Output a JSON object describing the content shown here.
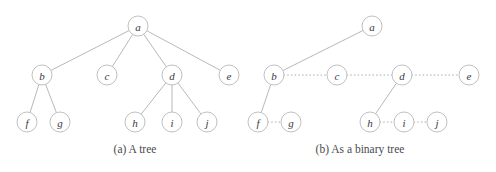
{
  "figure": {
    "width": 496,
    "height": 172,
    "background": "#ffffff",
    "node_radius": 10,
    "node_stroke": "#b9b9bd",
    "node_fill": "#ffffff",
    "edge_color": "#b0b0b5",
    "label_color": "#3a3a3f",
    "caption_color": "#4a4a4e"
  },
  "panels": [
    {
      "id": "panel-a",
      "caption": "(a) A tree",
      "caption_x": 135,
      "caption_y": 153,
      "nodes": [
        {
          "id": "a",
          "label": "a",
          "x": 138,
          "y": 26
        },
        {
          "id": "b",
          "label": "b",
          "x": 42,
          "y": 75
        },
        {
          "id": "c",
          "label": "c",
          "x": 107,
          "y": 75
        },
        {
          "id": "d",
          "label": "d",
          "x": 172,
          "y": 75
        },
        {
          "id": "e",
          "label": "e",
          "x": 229,
          "y": 75
        },
        {
          "id": "f",
          "label": "f",
          "x": 27,
          "y": 122
        },
        {
          "id": "g",
          "label": "g",
          "x": 60,
          "y": 122
        },
        {
          "id": "h",
          "label": "h",
          "x": 135,
          "y": 122
        },
        {
          "id": "i",
          "label": "i",
          "x": 172,
          "y": 122
        },
        {
          "id": "j",
          "label": "j",
          "x": 207,
          "y": 122
        }
      ],
      "edges": [
        {
          "from": "a",
          "to": "b",
          "style": "solid"
        },
        {
          "from": "a",
          "to": "c",
          "style": "solid"
        },
        {
          "from": "a",
          "to": "d",
          "style": "solid"
        },
        {
          "from": "a",
          "to": "e",
          "style": "solid"
        },
        {
          "from": "b",
          "to": "f",
          "style": "solid"
        },
        {
          "from": "b",
          "to": "g",
          "style": "solid"
        },
        {
          "from": "d",
          "to": "h",
          "style": "solid"
        },
        {
          "from": "d",
          "to": "i",
          "style": "solid"
        },
        {
          "from": "d",
          "to": "j",
          "style": "solid"
        }
      ]
    },
    {
      "id": "panel-b",
      "caption": "(b) As a binary tree",
      "caption_x": 360,
      "caption_y": 153,
      "nodes": [
        {
          "id": "a",
          "label": "a",
          "x": 372,
          "y": 26
        },
        {
          "id": "b",
          "label": "b",
          "x": 274,
          "y": 75
        },
        {
          "id": "c",
          "label": "c",
          "x": 337,
          "y": 75
        },
        {
          "id": "d",
          "label": "d",
          "x": 402,
          "y": 75
        },
        {
          "id": "e",
          "label": "e",
          "x": 469,
          "y": 75
        },
        {
          "id": "f",
          "label": "f",
          "x": 258,
          "y": 122
        },
        {
          "id": "g",
          "label": "g",
          "x": 291,
          "y": 122
        },
        {
          "id": "h",
          "label": "h",
          "x": 370,
          "y": 122
        },
        {
          "id": "i",
          "label": "i",
          "x": 404,
          "y": 122
        },
        {
          "id": "j",
          "label": "j",
          "x": 437,
          "y": 122
        }
      ],
      "edges": [
        {
          "from": "a",
          "to": "b",
          "style": "solid"
        },
        {
          "from": "b",
          "to": "c",
          "style": "dotted"
        },
        {
          "from": "c",
          "to": "d",
          "style": "dotted"
        },
        {
          "from": "d",
          "to": "e",
          "style": "dotted"
        },
        {
          "from": "b",
          "to": "f",
          "style": "solid"
        },
        {
          "from": "f",
          "to": "g",
          "style": "dotted"
        },
        {
          "from": "d",
          "to": "h",
          "style": "solid"
        },
        {
          "from": "h",
          "to": "i",
          "style": "dotted"
        },
        {
          "from": "i",
          "to": "j",
          "style": "dotted"
        }
      ]
    }
  ]
}
